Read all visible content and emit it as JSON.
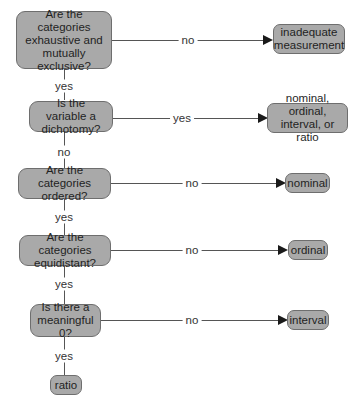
{
  "diagram": {
    "type": "flowchart",
    "questions": [
      {
        "id": "q1",
        "text": "Are the categories exhaustive and mutually exclusive?"
      },
      {
        "id": "q2",
        "text": "Is the variable a dichotomy?"
      },
      {
        "id": "q3",
        "text": "Are the categories ordered?"
      },
      {
        "id": "q4",
        "text": "Are the categories equidistant?"
      },
      {
        "id": "q5",
        "text": "Is there a meaningful 0?"
      }
    ],
    "outcomes": [
      {
        "id": "o1",
        "text": "inadequate measurement"
      },
      {
        "id": "o2",
        "text": "nominal, ordinal, interval, or ratio"
      },
      {
        "id": "o3",
        "text": "nominal"
      },
      {
        "id": "o4",
        "text": "ordinal"
      },
      {
        "id": "o5",
        "text": "interval"
      },
      {
        "id": "o6",
        "text": "ratio"
      }
    ],
    "edges": [
      {
        "from": "q1",
        "to": "o1",
        "label": "no"
      },
      {
        "from": "q1",
        "to": "q2",
        "label": "yes"
      },
      {
        "from": "q2",
        "to": "o2",
        "label": "yes"
      },
      {
        "from": "q2",
        "to": "q3",
        "label": "no"
      },
      {
        "from": "q3",
        "to": "o3",
        "label": "no"
      },
      {
        "from": "q3",
        "to": "q4",
        "label": "yes"
      },
      {
        "from": "q4",
        "to": "o4",
        "label": "no"
      },
      {
        "from": "q4",
        "to": "q5",
        "label": "yes"
      },
      {
        "from": "q5",
        "to": "o5",
        "label": "no"
      },
      {
        "from": "q5",
        "to": "o6",
        "label": "yes"
      }
    ],
    "colors": {
      "box_fill": "#a9a9a9",
      "box_border": "#6e6e6e",
      "line": "#555555",
      "arrow": "#1a1a1a"
    }
  }
}
